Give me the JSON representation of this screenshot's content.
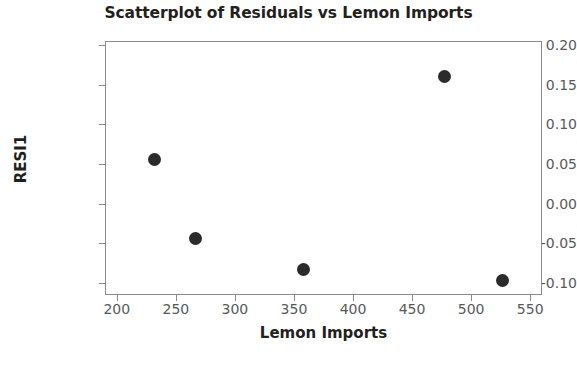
{
  "chart_data": {
    "type": "scatter",
    "title": "Scatterplot of Residuals vs Lemon Imports",
    "xlabel": "Lemon Imports",
    "ylabel": "RESI1",
    "xlim": [
      190,
      560
    ],
    "ylim": [
      -0.115,
      0.205
    ],
    "xticks": [
      200,
      250,
      300,
      350,
      400,
      450,
      500,
      550
    ],
    "xtick_labels": [
      "200",
      "250",
      "300",
      "350",
      "400",
      "450",
      "500",
      "550"
    ],
    "yticks": [
      0.2,
      0.15,
      0.1,
      0.05,
      0.0,
      -0.05,
      -0.1
    ],
    "ytick_labels": [
      "0.20",
      "0.15",
      "0.10",
      "0.05",
      "0.00",
      "-0.05",
      "-0.10"
    ],
    "grid": false,
    "legend": false,
    "marker_color": "#2b2b2b",
    "marker_size": 13,
    "frame_color": "#8a8a8a",
    "points": [
      {
        "x": 231,
        "y": 0.057
      },
      {
        "x": 266,
        "y": -0.043
      },
      {
        "x": 357,
        "y": -0.082
      },
      {
        "x": 477,
        "y": 0.162
      },
      {
        "x": 526,
        "y": -0.096
      }
    ]
  }
}
